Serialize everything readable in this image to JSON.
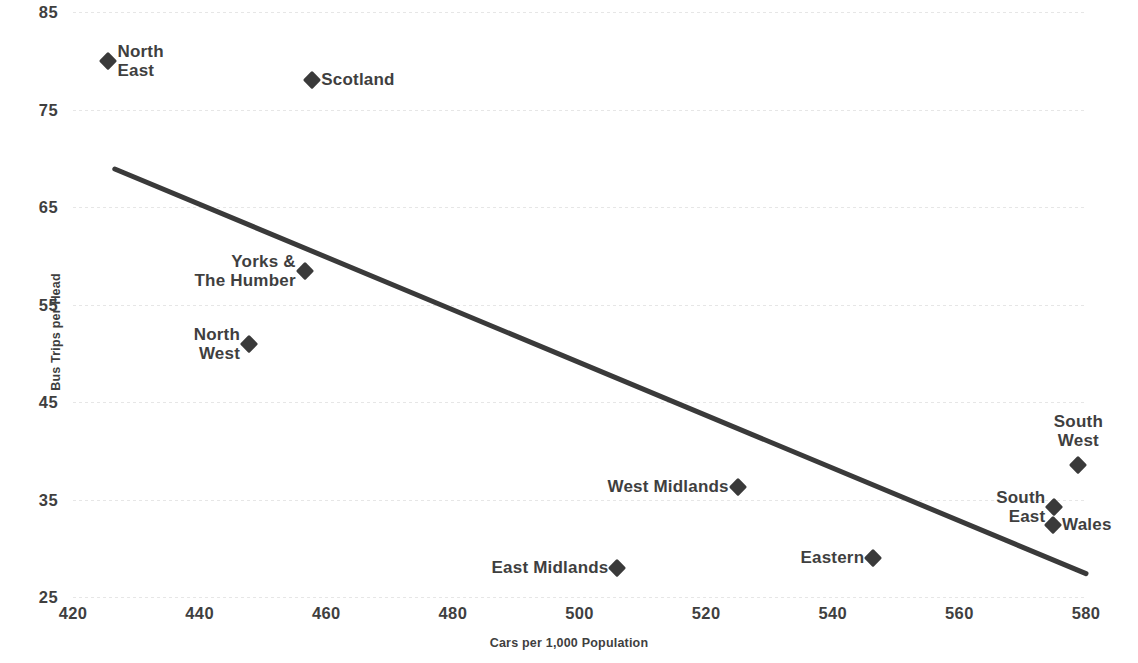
{
  "chart_data": {
    "type": "scatter",
    "title": "",
    "xlabel": "Cars per 1,000 Population",
    "ylabel": "Bus Trips per Head",
    "xlim": [
      420,
      580
    ],
    "ylim": [
      25,
      85
    ],
    "xticks": [
      420,
      440,
      460,
      480,
      500,
      520,
      540,
      560,
      580
    ],
    "yticks": [
      25,
      35,
      45,
      55,
      65,
      75,
      85
    ],
    "grid": "horizontal-dashed",
    "legend": "none",
    "marker": "diamond",
    "marker_color": "#3a3a3a",
    "grid_color": "#e6e6e6",
    "text_color": "#3f3f3f",
    "points": [
      {
        "label": "North\nEast",
        "x": 425.6,
        "y": 80.0,
        "label_side": "right"
      },
      {
        "label": "Scotland",
        "x": 457.8,
        "y": 78.0,
        "label_side": "right"
      },
      {
        "label": "Yorks &\nThe Humber",
        "x": 456.6,
        "y": 58.4,
        "label_side": "left"
      },
      {
        "label": "North\nWest",
        "x": 447.8,
        "y": 51.0,
        "label_side": "left"
      },
      {
        "label": "West Midlands",
        "x": 525.0,
        "y": 36.3,
        "label_side": "left"
      },
      {
        "label": "East Midlands",
        "x": 506.0,
        "y": 28.0,
        "label_side": "left"
      },
      {
        "label": "Eastern",
        "x": 546.4,
        "y": 29.0,
        "label_side": "left"
      },
      {
        "label": "South\nWest",
        "x": 578.8,
        "y": 38.5,
        "label_side": "above"
      },
      {
        "label": "South\nEast",
        "x": 575.0,
        "y": 34.2,
        "label_side": "left"
      },
      {
        "label": "Wales",
        "x": 574.8,
        "y": 32.4,
        "label_side": "right"
      }
    ],
    "trendline": {
      "type": "linear",
      "color": "#3a3a3a",
      "width": 5,
      "x_start": 426.6,
      "y_start": 68.9,
      "x_end": 580.0,
      "y_end": 27.4
    }
  }
}
